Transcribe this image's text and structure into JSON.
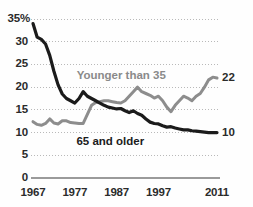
{
  "chart_data": {
    "type": "line",
    "title": "",
    "subtitle": "",
    "xlabel": "",
    "ylabel": "",
    "xlim": [
      1967,
      2011
    ],
    "ylim": [
      0,
      35
    ],
    "grid": true,
    "grid_axis": "y",
    "legend_position": "inline-annotation",
    "y_ticks": [
      "35%",
      "30",
      "25",
      "20",
      "15",
      "10",
      "5",
      "0"
    ],
    "y_tick_values": [
      35,
      30,
      25,
      20,
      15,
      10,
      5,
      0
    ],
    "x_ticks": [
      "1967",
      "1977",
      "1987",
      "1997",
      "2011"
    ],
    "x_tick_values": [
      1967,
      1977,
      1987,
      1997,
      2011
    ],
    "x": [
      1967,
      1968,
      1969,
      1970,
      1971,
      1972,
      1973,
      1974,
      1975,
      1976,
      1977,
      1978,
      1979,
      1980,
      1981,
      1982,
      1983,
      1984,
      1985,
      1986,
      1987,
      1988,
      1989,
      1990,
      1991,
      1992,
      1993,
      1994,
      1995,
      1996,
      1997,
      1998,
      1999,
      2000,
      2001,
      2002,
      2003,
      2004,
      2005,
      2006,
      2007,
      2008,
      2009,
      2010,
      2011
    ],
    "series": [
      {
        "name": "65 and older",
        "color": "#1b1b1b",
        "end_value_label": "10",
        "values": [
          34.0,
          31.0,
          30.5,
          29.5,
          27.0,
          23.5,
          20.5,
          18.5,
          17.5,
          17.0,
          16.5,
          17.5,
          19.0,
          18.0,
          17.5,
          17.0,
          16.5,
          16.0,
          15.6,
          15.4,
          15.2,
          15.3,
          14.8,
          14.4,
          14.8,
          14.2,
          13.8,
          13.0,
          12.3,
          12.0,
          11.9,
          11.5,
          11.2,
          11.3,
          11.0,
          10.8,
          10.6,
          10.6,
          10.4,
          10.3,
          10.2,
          10.1,
          10.0,
          10.0,
          10.0
        ]
      },
      {
        "name": "Younger than 35",
        "color": "#8d8d8d",
        "end_value_label": "22",
        "values": [
          12.4,
          11.8,
          11.6,
          12.0,
          13.0,
          12.1,
          11.9,
          12.6,
          12.6,
          12.2,
          12.1,
          12.0,
          12.0,
          14.0,
          16.0,
          16.6,
          16.8,
          17.0,
          17.0,
          16.8,
          16.6,
          16.5,
          17.0,
          18.0,
          19.0,
          20.0,
          19.0,
          18.6,
          18.2,
          17.6,
          18.0,
          17.0,
          15.6,
          14.6,
          16.0,
          17.0,
          18.0,
          17.6,
          17.0,
          18.0,
          18.6,
          20.0,
          21.6,
          22.2,
          22.0
        ]
      }
    ],
    "annotations": [
      {
        "text": "Younger than 35",
        "color": "#8a8a8a",
        "x": 1987,
        "y": 22.5
      },
      {
        "text": "65 and older",
        "color": "#1b1b1b",
        "x": 1986,
        "y": 8.0
      }
    ],
    "axis_line_color": "#9a9a9a",
    "grid_color": "#b9b9b9",
    "background": "#fefefe"
  }
}
